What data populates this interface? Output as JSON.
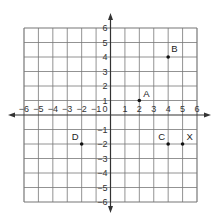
{
  "chart_data": {
    "type": "scatter",
    "title": "",
    "xlabel": "",
    "ylabel": "",
    "xlim": [
      -6,
      6
    ],
    "ylim": [
      -6,
      6
    ],
    "grid": true,
    "x_ticks": [
      -6,
      -5,
      -4,
      -3,
      -2,
      -1,
      1,
      2,
      3,
      4,
      5,
      6
    ],
    "y_ticks": [
      6,
      5,
      4,
      3,
      2,
      1,
      -1,
      -2,
      -3,
      -4,
      -5,
      -6
    ],
    "origin_label": "0",
    "points": [
      {
        "label": "A",
        "x": 2,
        "y": 1
      },
      {
        "label": "B",
        "x": 4,
        "y": 4
      },
      {
        "label": "C",
        "x": 4,
        "y": -2
      },
      {
        "label": "X",
        "x": 5,
        "y": -2
      },
      {
        "label": "D",
        "x": -2,
        "y": -2
      }
    ]
  },
  "colors": {
    "grid": "#777777",
    "axis": "#333333",
    "point": "#111111",
    "background": "#ffffff"
  }
}
